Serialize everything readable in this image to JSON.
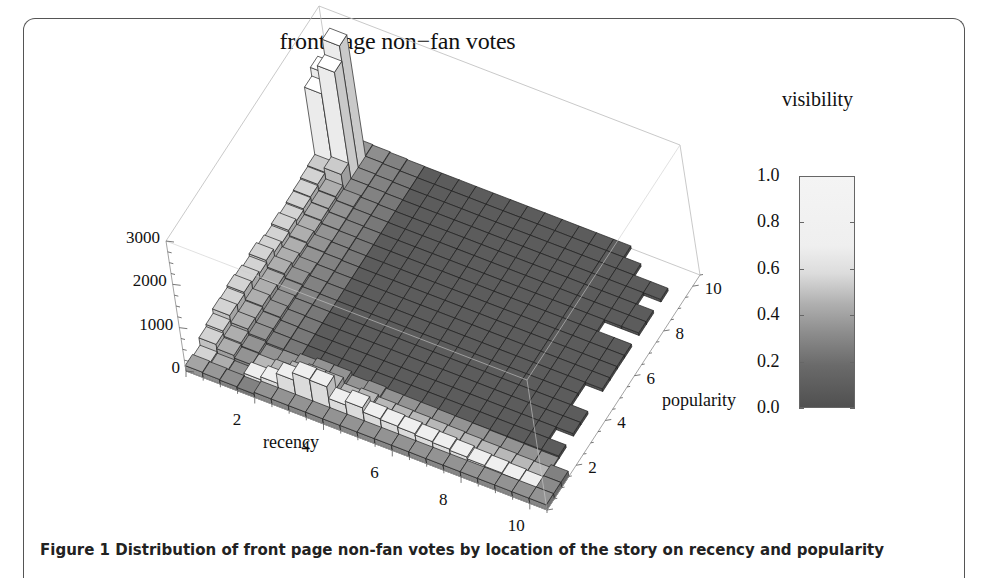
{
  "figure": {
    "caption": "Figure 1 Distribution of front page non-fan votes by location of the story on recency and popularity"
  },
  "chart_data": {
    "type": "bar3d",
    "title": "front page non−fan votes",
    "xlabel": "recency",
    "ylabel": "popularity",
    "zlabel": "",
    "x_ticks": [
      "2",
      "4",
      "6",
      "8",
      "10"
    ],
    "y_ticks": [
      "2",
      "4",
      "6",
      "8",
      "10"
    ],
    "z_ticks": [
      "0",
      "1000",
      "2000",
      "3000"
    ],
    "xlim": [
      0,
      10.5
    ],
    "ylim": [
      0,
      10.5
    ],
    "zlim": [
      0,
      3000
    ],
    "bins_per_unit": 2,
    "grid": false,
    "legend": {
      "title": "visibility",
      "position": "right",
      "ticks": [
        "1.0",
        "0.8",
        "0.6",
        "0.4",
        "0.2",
        "0.0"
      ],
      "colormap": "grayscale (dark=0.0, light=1.0)"
    },
    "peak_bars": [
      {
        "recency": 1.0,
        "popularity": 10.0,
        "votes": 2900,
        "visibility": 1.0
      },
      {
        "recency": 1.0,
        "popularity": 9.5,
        "votes": 2550,
        "visibility": 1.0
      },
      {
        "recency": 0.5,
        "popularity": 10.0,
        "votes": 2100,
        "visibility": 1.0
      },
      {
        "recency": 0.5,
        "popularity": 9.5,
        "votes": 1900,
        "visibility": 1.0
      },
      {
        "recency": 1.0,
        "popularity": 9.0,
        "votes": 450,
        "visibility": 0.7
      },
      {
        "recency": 0.5,
        "popularity": 9.0,
        "votes": 350,
        "visibility": 0.7
      }
    ],
    "front_row": {
      "popularity": 1.0,
      "recency": [
        2.0,
        2.5,
        3.0,
        3.5,
        4.0,
        4.5,
        5.0,
        5.5,
        6.0,
        6.5,
        7.0,
        7.5,
        8.0,
        8.5,
        9.0,
        9.5,
        10.0
      ],
      "votes": [
        150,
        220,
        450,
        620,
        600,
        330,
        420,
        320,
        300,
        280,
        250,
        230,
        200,
        160,
        140,
        120,
        100
      ]
    },
    "left_column": {
      "recency": 0.5,
      "popularity": [
        1.0,
        1.5,
        2.0,
        2.5,
        3.0,
        3.5,
        4.0,
        4.5,
        5.0,
        5.5,
        6.0,
        6.5,
        7.0,
        7.5,
        8.0,
        8.5
      ],
      "votes": [
        80,
        250,
        300,
        400,
        380,
        420,
        380,
        330,
        380,
        300,
        260,
        300,
        250,
        280,
        300,
        330
      ]
    },
    "background_level": {
      "votes": 60,
      "visibility": 0.1
    }
  }
}
